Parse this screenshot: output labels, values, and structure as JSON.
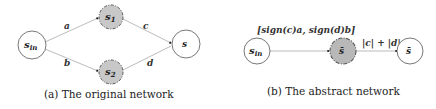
{
  "panel_a": {
    "caption": "(a) The original network",
    "nodes": [
      {
        "id": "s_in",
        "main": "s",
        "sub": "in",
        "style": "plain"
      },
      {
        "id": "s1",
        "main": "s",
        "sub": "1",
        "style": "abstract"
      },
      {
        "id": "s2",
        "main": "s",
        "sub": "2",
        "style": "abstract"
      },
      {
        "id": "s",
        "main": "s",
        "sub": "",
        "style": "plain"
      }
    ],
    "edges": [
      {
        "from": "s_in",
        "to": "s1",
        "label": "a"
      },
      {
        "from": "s_in",
        "to": "s2",
        "label": "b"
      },
      {
        "from": "s1",
        "to": "s",
        "label": "c"
      },
      {
        "from": "s2",
        "to": "s",
        "label": "d"
      }
    ]
  },
  "panel_b": {
    "caption": "(b) The abstract network",
    "nodes": [
      {
        "id": "s_in",
        "main": "s",
        "sub": "in",
        "style": "plain"
      },
      {
        "id": "s_bar",
        "main": "s̄",
        "sub": "",
        "style": "abstract"
      },
      {
        "id": "s_out_bar",
        "main": "s̄",
        "sub": "",
        "style": "plain"
      }
    ],
    "edges": [
      {
        "from": "s_in",
        "to": "s_bar",
        "label": "[sign(c)a, sign(d)b]"
      },
      {
        "from": "s_bar",
        "to": "s_out_bar",
        "label": "|c| + |d|"
      }
    ]
  },
  "colors": {
    "plain_fill": "#ffffff",
    "abstract_fill": "#c8c8c8",
    "stroke": "#555555",
    "edge": "#aaaaaa"
  }
}
